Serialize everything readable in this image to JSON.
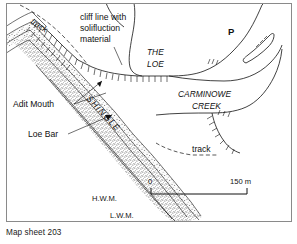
{
  "figure": {
    "caption": "Map sheet 203",
    "frame": {
      "border_color": "#8a8a8a",
      "background": "#ffffff"
    }
  },
  "map": {
    "title_labels": {
      "cliff_line": [
        "cliff line with",
        "solifluction",
        "material"
      ],
      "adit_mouth": "Adit Mouth",
      "loe_bar": "Loe Bar",
      "shingle": "SHINGLE",
      "the_loe_line1": "THE",
      "the_loe_line2": "LOE",
      "carminowe_line1": "CARMINOWE",
      "carminowe_line2": "CREEK",
      "parking": "P",
      "track_upper": "track",
      "track_lower": "track",
      "hwm": "H.W.M.",
      "lwm": "L.W.M."
    },
    "scale": {
      "start_label": "0",
      "end_label": "150 m",
      "length_m": 150
    },
    "colors": {
      "ink": "#111111",
      "stipple": "#4a4a4a",
      "frame": "#8a8a8a",
      "paper": "#ffffff"
    }
  }
}
